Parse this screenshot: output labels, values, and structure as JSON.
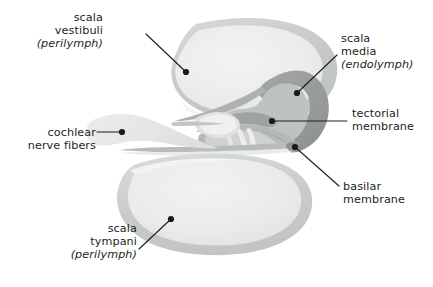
{
  "figure": {
    "width": 433,
    "height": 287,
    "background": "#ffffff"
  },
  "labels": {
    "scala_vestibuli": {
      "line1": "scala",
      "line2": "vestibuli",
      "line3": "(perilymph)",
      "align": "right"
    },
    "cochlear_nerve_fibers": {
      "line1": "cochlear",
      "line2": "nerve fibers",
      "align": "right"
    },
    "scala_tympani": {
      "line1": "scala",
      "line2": "tympani",
      "line3": "(perilymph)",
      "align": "right"
    },
    "scala_media": {
      "line1": "scala",
      "line2": "media",
      "line3": "(endolymph)",
      "align": "left"
    },
    "tectorial_membrane": {
      "line1": "tectorial",
      "line2": "membrane",
      "align": "left"
    },
    "basilar_membrane": {
      "line1": "basilar",
      "line2": "membrane",
      "align": "left"
    }
  },
  "colors": {
    "text": "#231f20",
    "leader_line": "#231f20",
    "leader_dot": "#1a1a1a",
    "scala_lumen": "#eceeec",
    "scala_lumen_edge": "#e2e4e2",
    "scala_wall": "#c9ccc9",
    "scala_wall_light": "#dcdedc",
    "duct_dark": "#9a9e9c",
    "duct_mid": "#bcc0bd",
    "duct_light": "#d4d7d4",
    "corti_body": "#b7bbb8",
    "corti_pale": "#cfd2cf",
    "nerve_fibers": "#e6e8e6",
    "hair_cell": "#e9ebe9",
    "membrane_line": "#a8acaa"
  },
  "leaders": [
    {
      "name": "scala-vestibuli",
      "dot": [
        186,
        72
      ],
      "path": "M186,72 L146,34"
    },
    {
      "name": "cochlear-nerve-fibers",
      "dot": [
        122,
        132
      ],
      "path": "M122,132 L97,132"
    },
    {
      "name": "scala-tympani",
      "dot": [
        171,
        219
      ],
      "path": "M171,219 L139,249"
    },
    {
      "name": "scala-media",
      "dot": [
        297,
        93
      ],
      "path": "M297,93 L337,55"
    },
    {
      "name": "tectorial-membrane",
      "dot": [
        272,
        121
      ],
      "path": "M272,121 L347,121"
    },
    {
      "name": "basilar-membrane",
      "dot": [
        295,
        147
      ],
      "path": "M295,147 L339,186"
    }
  ],
  "structures": [
    "scala vestibuli lumen",
    "scala vestibuli wall",
    "scala media duct",
    "reissner membrane",
    "tectorial membrane",
    "organ of corti",
    "basilar membrane",
    "scala tympani lumen",
    "scala tympani wall",
    "cochlear nerve fibers",
    "spiral ganglion"
  ]
}
